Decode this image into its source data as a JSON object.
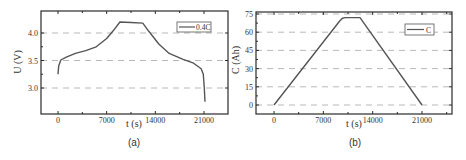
{
  "chart_data": [
    {
      "id": "a",
      "type": "line",
      "caption": "(a)",
      "title": "",
      "xlabel": "t (s)",
      "ylabel": "U (V)",
      "xlim": [
        -2500,
        24500
      ],
      "ylim": [
        2.55,
        4.4
      ],
      "xticks": [
        0,
        7000,
        14000,
        21000
      ],
      "xtick_labels": [
        "0",
        "7000",
        "14000",
        "21000"
      ],
      "yticks": [
        3.0,
        3.5,
        4.0
      ],
      "ytick_labels": [
        "3.0",
        "3.5",
        "4.0"
      ],
      "grid": "horizontal dashed",
      "legend": {
        "position": "upper right",
        "entries": [
          "0.4C"
        ]
      },
      "series": [
        {
          "name": "0.4C",
          "x": [
            0,
            100,
            400,
            1200,
            2500,
            4000,
            5500,
            7000,
            8000,
            8900,
            10500,
            12200,
            13000,
            14500,
            16000,
            18000,
            19500,
            20600,
            20900,
            21050,
            21150
          ],
          "y": [
            3.25,
            3.4,
            3.51,
            3.56,
            3.63,
            3.68,
            3.75,
            3.9,
            4.05,
            4.2,
            4.19,
            4.18,
            4.04,
            3.8,
            3.63,
            3.52,
            3.45,
            3.35,
            3.25,
            3.0,
            2.75
          ]
        }
      ]
    },
    {
      "id": "b",
      "type": "line",
      "caption": "(b)",
      "title": "",
      "xlabel": "t (s)",
      "ylabel": "C (Ah)",
      "xlim": [
        -2500,
        24500
      ],
      "ylim": [
        -6,
        76
      ],
      "xticks": [
        0,
        7000,
        14000,
        21000
      ],
      "xtick_labels": [
        "0",
        "7000",
        "14000",
        "21000"
      ],
      "yticks": [
        0,
        15,
        30,
        45,
        60,
        75
      ],
      "ytick_labels": [
        "0",
        "15",
        "30",
        "45",
        "60",
        "75"
      ],
      "grid": "horizontal dashed",
      "legend": {
        "position": "upper right",
        "entries": [
          "C"
        ]
      },
      "series": [
        {
          "name": "C",
          "x": [
            0,
            9300,
            9700,
            10100,
            12200,
            21000
          ],
          "y": [
            0,
            69,
            71.5,
            72,
            72,
            0
          ]
        }
      ]
    }
  ]
}
